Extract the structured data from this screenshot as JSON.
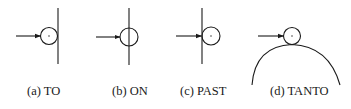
{
  "figure": {
    "panels": [
      {
        "id": "a",
        "label": "(a) TO",
        "relation": "TO"
      },
      {
        "id": "b",
        "label": "(b) ON",
        "relation": "ON"
      },
      {
        "id": "c",
        "label": "(c) PAST",
        "relation": "PAST"
      },
      {
        "id": "d",
        "label": "(d) TANTO",
        "relation": "TANTO"
      }
    ],
    "colors": {
      "stroke": "#1a1a1a",
      "background": "#ffffff"
    }
  }
}
